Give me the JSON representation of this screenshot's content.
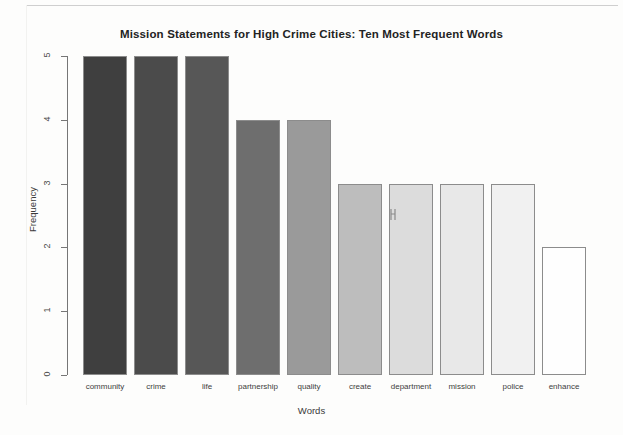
{
  "chart_data": {
    "type": "bar",
    "title": "Mission Statements for High Crime Cities: Ten Most Frequent Words",
    "xlabel": "Words",
    "ylabel": "Frequency",
    "categories": [
      "community",
      "crime",
      "life",
      "partnership",
      "quality",
      "create",
      "department",
      "mission",
      "police",
      "enhance"
    ],
    "values": [
      5,
      5,
      5,
      4,
      4,
      3,
      3,
      3,
      3,
      2
    ],
    "bar_colors": [
      "#3f3f3f",
      "#4b4b4b",
      "#575757",
      "#6e6e6e",
      "#9a9a9a",
      "#bdbdbd",
      "#dcdcdc",
      "#e8e8e8",
      "#f1f1f1",
      "#fefefe"
    ],
    "bar_border_color": "#8c8c8c",
    "ylim": [
      0,
      5
    ],
    "yticks": [
      0,
      1,
      2,
      3,
      4,
      5
    ],
    "ytick_labels": [
      "0",
      "1",
      "2",
      "3",
      "4",
      "5"
    ],
    "grid": false,
    "legend": null,
    "legend_position": "none",
    "axis_color": "#767676",
    "background": "#fdfdfc"
  },
  "cursor": {
    "glyph": "↕",
    "name": "mouse-pointer"
  }
}
